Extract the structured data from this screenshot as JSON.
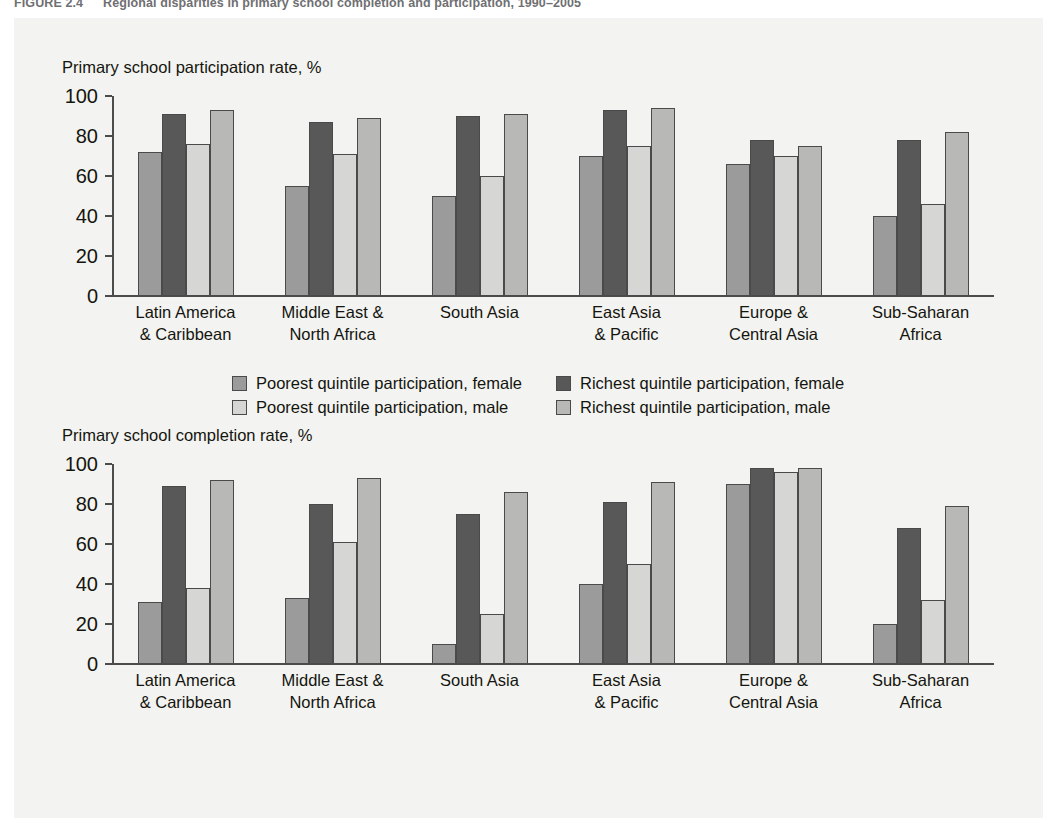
{
  "figure": {
    "number": "FIGURE 2.4",
    "caption": "Regional disparities in primary school completion and participation, 1990–2005"
  },
  "colors": {
    "poorest_female": "#9b9b9b",
    "richest_female": "#585858",
    "poorest_male": "#d6d6d4",
    "richest_male": "#b8b8b6",
    "panel_bg": "#f3f3f1",
    "axis": "#4c4c4c"
  },
  "chart_data": [
    {
      "type": "bar",
      "title": "Primary school participation rate, %",
      "xlabel": "",
      "ylabel": "",
      "ylim": [
        0,
        100
      ],
      "yticks": [
        "0",
        "20",
        "40",
        "60",
        "80",
        "100"
      ],
      "grid": false,
      "legend_position": "bottom",
      "categories": [
        [
          "Latin America",
          "& Caribbean"
        ],
        [
          "Middle East &",
          "North Africa"
        ],
        [
          "South Asia",
          ""
        ],
        [
          "East Asia",
          "& Pacific"
        ],
        [
          "Europe &",
          "Central Asia"
        ],
        [
          "Sub-Saharan",
          "Africa"
        ]
      ],
      "series": [
        {
          "name": "Poorest quintile participation, female",
          "color_key": "poorest_female",
          "values": [
            72,
            55,
            50,
            70,
            66,
            40
          ]
        },
        {
          "name": "Richest quintile participation, female",
          "color_key": "richest_female",
          "values": [
            91,
            87,
            90,
            93,
            78,
            78
          ]
        },
        {
          "name": "Poorest quintile participation, male",
          "color_key": "poorest_male",
          "values": [
            76,
            71,
            60,
            75,
            70,
            46
          ]
        },
        {
          "name": "Richest quintile participation, male",
          "color_key": "richest_male",
          "values": [
            93,
            89,
            91,
            94,
            75,
            82
          ]
        }
      ],
      "legend": [
        "Poorest quintile participation, female",
        "Richest quintile participation, female",
        "Poorest quintile participation, male",
        "Richest quintile participation, male"
      ]
    },
    {
      "type": "bar",
      "title": "Primary school completion rate, %",
      "xlabel": "",
      "ylabel": "",
      "ylim": [
        0,
        100
      ],
      "yticks": [
        "0",
        "20",
        "40",
        "60",
        "80",
        "100"
      ],
      "grid": false,
      "legend_position": "bottom",
      "categories": [
        [
          "Latin America",
          "& Caribbean"
        ],
        [
          "Middle East &",
          "North Africa"
        ],
        [
          "South Asia",
          ""
        ],
        [
          "East Asia",
          "& Pacific"
        ],
        [
          "Europe &",
          "Central Asia"
        ],
        [
          "Sub-Saharan",
          "Africa"
        ]
      ],
      "series": [
        {
          "name": "Poorest quintile completion, female",
          "color_key": "poorest_female",
          "values": [
            31,
            33,
            10,
            40,
            90,
            20
          ]
        },
        {
          "name": "Richest quintile completion, female",
          "color_key": "richest_female",
          "values": [
            89,
            80,
            75,
            81,
            98,
            68
          ]
        },
        {
          "name": "Poorest quintile completion, male",
          "color_key": "poorest_male",
          "values": [
            38,
            61,
            25,
            50,
            96,
            32
          ]
        },
        {
          "name": "Richest quintile completion, male",
          "color_key": "richest_male",
          "values": [
            92,
            93,
            86,
            91,
            98,
            79
          ]
        }
      ],
      "legend": [
        "Poorest quintile completion, female",
        "Richest quintile completion, female",
        "Poorest quintile completion, male",
        "Richest quintile completion, male"
      ]
    }
  ]
}
